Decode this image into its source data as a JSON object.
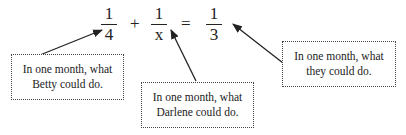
{
  "equation": {
    "term1": {
      "numerator": "1",
      "denominator": "4"
    },
    "plus": "+",
    "term2": {
      "numerator": "1",
      "denominator": "x"
    },
    "equals": "=",
    "result": {
      "numerator": "1",
      "denominator": "3"
    }
  },
  "callouts": [
    {
      "line1": "In one month, what",
      "line2": "Betty could do.",
      "points_to": "1/4"
    },
    {
      "line1": "In one month, what",
      "line2": "Darlene could do.",
      "points_to": "1/x"
    },
    {
      "line1": "In one month, what",
      "line2": "they could do.",
      "points_to": "1/3"
    }
  ],
  "colors": {
    "ink": "#222222",
    "background": "#ffffff"
  }
}
